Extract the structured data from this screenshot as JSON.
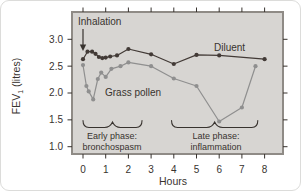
{
  "colors": {
    "diluent": "#423a36",
    "grass_pollen": "#8f8f8f",
    "panel_bg": "#d7d5d2",
    "panel_border": "#8f8b86",
    "text": "#38332f"
  },
  "chart_data": {
    "type": "line",
    "title": "",
    "xlabel": "Hours",
    "ylabel": "FEV₁ (litres)",
    "xlim": [
      0,
      8
    ],
    "ylim": [
      1.0,
      3.0
    ],
    "x_ticks": [
      0,
      1,
      2,
      3,
      4,
      5,
      6,
      7,
      8
    ],
    "y_ticks": [
      3.0,
      2.5,
      2.0,
      1.5,
      1.0
    ],
    "grid": false,
    "legend_position": "inline-labels",
    "series": [
      {
        "name": "Diluent",
        "points": [
          [
            0,
            2.63
          ],
          [
            0.2,
            2.77
          ],
          [
            0.4,
            2.77
          ],
          [
            0.55,
            2.73
          ],
          [
            0.7,
            2.67
          ],
          [
            0.85,
            2.65
          ],
          [
            1.0,
            2.66
          ],
          [
            1.2,
            2.68
          ],
          [
            1.5,
            2.7
          ],
          [
            2.0,
            2.82
          ],
          [
            3.0,
            2.72
          ],
          [
            4.0,
            2.54
          ],
          [
            5.0,
            2.71
          ],
          [
            6.0,
            2.7
          ],
          [
            8.0,
            2.63
          ]
        ]
      },
      {
        "name": "Grass pollen",
        "points": [
          [
            0,
            2.52
          ],
          [
            0.15,
            2.13
          ],
          [
            0.25,
            2.03
          ],
          [
            0.45,
            1.88
          ],
          [
            0.65,
            2.26
          ],
          [
            0.8,
            2.38
          ],
          [
            1.0,
            2.3
          ],
          [
            1.25,
            2.45
          ],
          [
            1.65,
            2.5
          ],
          [
            2.0,
            2.57
          ],
          [
            3.0,
            2.5
          ],
          [
            4.0,
            2.27
          ],
          [
            5.0,
            2.13
          ],
          [
            6.0,
            1.47
          ],
          [
            7.0,
            1.73
          ],
          [
            7.6,
            2.5
          ]
        ]
      }
    ],
    "annotations": {
      "inhalation": {
        "text": "Inhalation",
        "x": 0
      },
      "early_phase": {
        "line1": "Early phase:",
        "line2": "bronchospasm",
        "x_start": 0,
        "x_end": 2.6
      },
      "late_phase": {
        "line1": "Late phase:",
        "line2": "inflammation",
        "x_start": 3.9,
        "x_end": 7.7
      }
    }
  }
}
